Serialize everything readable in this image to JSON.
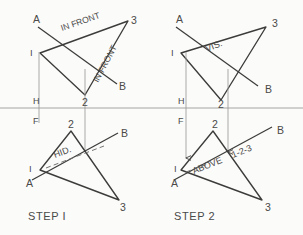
{
  "sheet": {
    "background": "#fbfbfa",
    "ink": "#3c3c3a",
    "thin_ink": "#8d8d8a",
    "width": 303,
    "height": 235
  },
  "panels": [
    {
      "id": "step-1",
      "caption": "STEP I",
      "caption_pos": [
        28,
        220
      ],
      "top_view": {
        "label_H": "H",
        "label_H_pos": [
          33,
          104
        ],
        "points_line": {
          "A": "A",
          "B": "B"
        },
        "label_A_pos": [
          33,
          23
        ],
        "label_B_pos": [
          119,
          90
        ],
        "triangle_labels": {
          "v1": "I",
          "v2": "2",
          "v3": "3"
        },
        "label_1_pos": [
          30,
          56
        ],
        "label_2_pos": [
          82,
          104
        ],
        "label_3_pos": [
          131,
          24
        ],
        "notes": [
          {
            "text": "IN FRONT",
            "pos": [
              62,
              31
            ],
            "rotation": -19
          },
          {
            "text": "IN FRONT",
            "pos": [
              98,
              83
            ],
            "rotation": -62
          }
        ]
      },
      "front_view": {
        "label_F": "F",
        "label_F_pos": [
          33,
          124
        ],
        "points_line": {
          "A": "A",
          "B": "B"
        },
        "label_A_pos": [
          26,
          185
        ],
        "label_B_pos": [
          121,
          137
        ],
        "triangle_labels": {
          "v1": "I",
          "v2": "2",
          "v3": "3"
        },
        "label_1_pos": [
          29,
          172
        ],
        "label_2_pos": [
          68,
          128
        ],
        "label_3_pos": [
          120,
          210
        ],
        "notes": [
          {
            "text": "HID.",
            "pos": [
              55,
              158
            ],
            "rotation": -21
          }
        ]
      }
    },
    {
      "id": "step-2",
      "caption": "STEP 2",
      "caption_pos": [
        174,
        220
      ],
      "top_view": {
        "label_H": "H",
        "label_H_pos": [
          178,
          104
        ],
        "points_line": {
          "A": "A",
          "B": "B"
        },
        "label_A_pos": [
          176,
          23
        ],
        "label_B_pos": [
          265,
          92
        ],
        "triangle_labels": {
          "v1": "I",
          "v2": "2",
          "v3": "3"
        },
        "label_1_pos": [
          171,
          56
        ],
        "label_2_pos": [
          218,
          106
        ],
        "label_3_pos": [
          272,
          26
        ],
        "notes": [
          {
            "text": "VIS.",
            "pos": [
              213,
              48
            ],
            "rotation": -22
          }
        ]
      },
      "front_view": {
        "label_F": "F",
        "label_F_pos": [
          178,
          124
        ],
        "points_line": {
          "A": "A",
          "B": "B"
        },
        "label_A_pos": [
          171,
          185
        ],
        "label_B_pos": [
          277,
          134
        ],
        "triangle_labels": {
          "v1": "I",
          "v2": "2",
          "v3": "3"
        },
        "label_1_pos": [
          174,
          172
        ],
        "label_2_pos": [
          212,
          128
        ],
        "label_3_pos": [
          265,
          210
        ],
        "notes": [
          {
            "text": "ABOVE",
            "pos": [
              198,
              171
            ],
            "rotation": -22
          },
          {
            "text": "1-2-3",
            "pos": [
              238,
              155
            ],
            "rotation": -22
          }
        ]
      }
    }
  ],
  "fold_line": {
    "y": 108,
    "x1": 0,
    "x2": 303
  },
  "geometry": {
    "step1_top_triangle": [
      [
        40,
        53
      ],
      [
        85,
        95
      ],
      [
        128,
        21
      ]
    ],
    "step1_top_ab": [
      [
        38,
        27
      ],
      [
        117,
        84
      ]
    ],
    "step1_front_triangle": [
      [
        40,
        170
      ],
      [
        71,
        131
      ],
      [
        119,
        200
      ]
    ],
    "step1_front_ab": [
      [
        32,
        180
      ],
      [
        118,
        133
      ]
    ],
    "step1_projectors": [
      {
        "x": 39,
        "y1": 52,
        "y2": 123,
        "arrow": false
      },
      {
        "x": 85,
        "y1": 69,
        "y2": 152,
        "arrow": false
      }
    ],
    "step1_hidden_segment": [
      [
        46,
        168
      ],
      [
        104,
        146
      ]
    ],
    "step2_top_triangle": [
      [
        181,
        53
      ],
      [
        221,
        100
      ],
      [
        266,
        27
      ]
    ],
    "step2_top_ab": [
      [
        176,
        27
      ],
      [
        258,
        86
      ]
    ],
    "step2_front_triangle": [
      [
        181,
        170
      ],
      [
        213,
        131
      ],
      [
        262,
        200
      ]
    ],
    "step2_front_ab": [
      [
        174,
        180
      ],
      [
        272,
        127
      ]
    ],
    "step2_projectors": [
      {
        "x": 186,
        "y1": 52,
        "y2": 158,
        "arrow": true
      },
      {
        "x": 228,
        "y1": 69,
        "y2": 152,
        "arrow": true
      }
    ],
    "step2_hidden_segment": [
      [
        186,
        172
      ],
      [
        206,
        165
      ]
    ]
  }
}
